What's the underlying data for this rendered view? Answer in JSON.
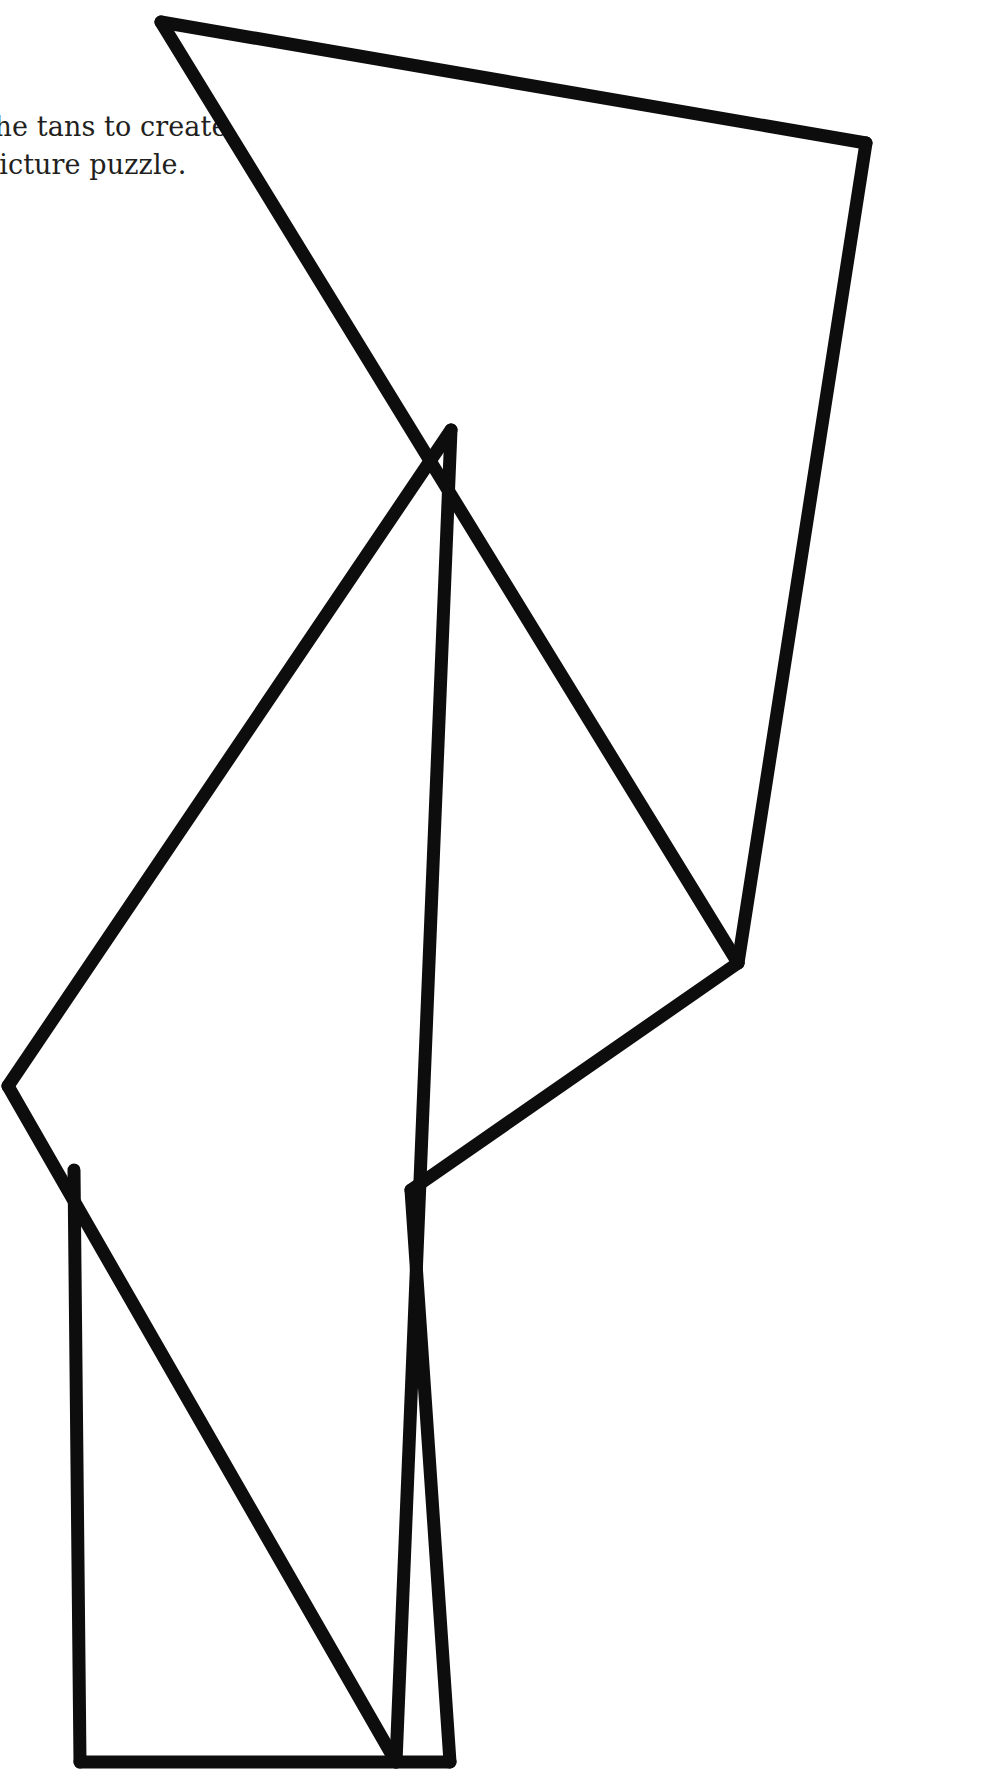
{
  "page": {
    "background_color": "#ffffff",
    "width": 995,
    "height": 1784
  },
  "instructions": {
    "name": "instruction-text",
    "clipped_at_left_edge": true,
    "lines": [
      "Use the tans to create",
      "this picture puzzle."
    ],
    "visible_fragments": [
      "reate",
      "zle."
    ],
    "color": "#231f20",
    "font_size_px": 27
  },
  "figure": {
    "name": "tangram-outline-figure",
    "stroke_color": "#0d0d0d",
    "fill_color": "#ffffff",
    "stroke_width": 13,
    "vertices": {
      "top_peak": [
        161,
        22
      ],
      "top_right": [
        866,
        143
      ],
      "right_lower": [
        738,
        963
      ],
      "center_junction": [
        451,
        430
      ],
      "mid_left_point": [
        8,
        1086
      ],
      "mid_right_notch": [
        411,
        1190
      ],
      "rect_top_left": [
        74,
        1170
      ],
      "rect_bottom_left": [
        80,
        1762
      ],
      "rect_bottom_right": [
        396,
        1762
      ],
      "spine_bottom": [
        396,
        1762
      ],
      "lower_right_corner": [
        450,
        1762
      ]
    },
    "segments": [
      {
        "name": "top-left-edge",
        "from": "top_peak",
        "to": "top_right"
      },
      {
        "name": "right-long-edge",
        "from": "top_right",
        "to": "right_lower"
      },
      {
        "name": "upper-diagonal",
        "from": "top_peak",
        "to": "right_lower"
      },
      {
        "name": "left-upper-diagonal",
        "from": "center_junction",
        "to": "mid_left_point"
      },
      {
        "name": "left-lower-diagonal",
        "from": "mid_left_point",
        "to": "rect_bottom_right"
      },
      {
        "name": "center-spine",
        "from": "center_junction",
        "to": "spine_bottom"
      },
      {
        "name": "lower-right-diagonal",
        "from": "right_lower",
        "to": "mid_right_notch"
      },
      {
        "name": "notch-to-corner",
        "from": "mid_right_notch",
        "to": "lower_right_corner"
      },
      {
        "name": "rect-left-side",
        "from": "rect_top_left",
        "to": "rect_bottom_left"
      },
      {
        "name": "rect-bottom-side",
        "from": "rect_bottom_left",
        "to": "lower_right_corner"
      }
    ]
  }
}
